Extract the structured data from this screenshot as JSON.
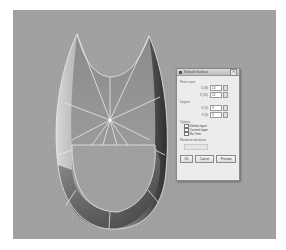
{
  "viewport": {
    "background": "#a2a2a2",
    "model": "tapered-surface-with-radial-isocurves"
  },
  "dialog": {
    "title": "Rebuild Surface",
    "close_glyph": "✕",
    "point_count": {
      "label": "Point count",
      "u_label": "U (8)",
      "u_value": "14",
      "v_label": "V (10)",
      "v_value": "12"
    },
    "degree": {
      "label": "Degree",
      "u_label": "U (3)",
      "u_value": "3",
      "v_label": "V (3)",
      "v_value": "3"
    },
    "options": {
      "label": "Options",
      "items": [
        {
          "label": "Delete input",
          "checked": false
        },
        {
          "label": "Current layer",
          "checked": false
        },
        {
          "label": "Re-Trim",
          "checked": false
        }
      ]
    },
    "max_deviation": {
      "label": "Maximum deviation",
      "value": ""
    },
    "buttons": {
      "ok": "OK",
      "cancel": "Cancel",
      "preview": "Preview"
    }
  }
}
